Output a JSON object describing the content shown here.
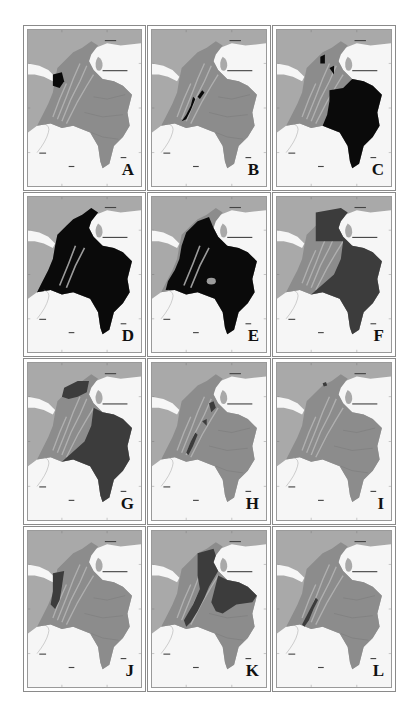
{
  "figure": {
    "type": "multi-panel map figure",
    "colors": {
      "sea": "#a9a9a9",
      "neighbour_land": "#f7f7f7",
      "colombia_base": "#8c8c8c",
      "andes_relief": "#b0b0b0",
      "highlight_black": "#0a0a0a",
      "highlight_dark": "#3c3c3c",
      "border_line": "#8a8a8a"
    },
    "panels": [
      {
        "label": "A",
        "highlight": "black",
        "region": "northwest Chocó / Urabá patch"
      },
      {
        "label": "B",
        "highlight": "black",
        "region": "narrow strips along southern Andes"
      },
      {
        "label": "C",
        "highlight": "black",
        "region": "eastern lowlands (Orinoquía & Amazonía) plus Caribbean spots"
      },
      {
        "label": "D",
        "highlight": "black",
        "region": "almost entire country except Andean highlands"
      },
      {
        "label": "E",
        "highlight": "black",
        "region": "most of country, with some lighter enclaves"
      },
      {
        "label": "F",
        "highlight": "dark",
        "region": "Caribbean north plus eastern plains and Amazon"
      },
      {
        "label": "G",
        "highlight": "dark",
        "region": "Caribbean north plus east and south"
      },
      {
        "label": "H",
        "highlight": "dark",
        "region": "small patches on eastern Andes slopes"
      },
      {
        "label": "I",
        "highlight": "dark",
        "region": "tiny spot in Sierra Nevada de Santa Marta"
      },
      {
        "label": "J",
        "highlight": "dark",
        "region": "Pacific / Chocó strip"
      },
      {
        "label": "K",
        "highlight": "dark",
        "region": "Caribbean, Magdalena valley and eastern plains"
      },
      {
        "label": "L",
        "highlight": "dark",
        "region": "narrow strip in southwestern Andes"
      }
    ],
    "map_labels": {
      "sea_label": "Mar Caribe",
      "east_label": "Venezuela",
      "southwest_label": "Ecuador",
      "south_label": "Perú",
      "southeast_label": "Brasil"
    }
  }
}
